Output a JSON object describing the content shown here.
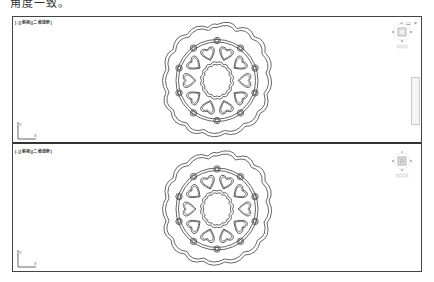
{
  "page": {
    "top_caption_cut": "角度一致。",
    "top_caption_cut_right": "一致一致"
  },
  "viewports": [
    {
      "id": "top",
      "label": "[-][俯视][二维线框]",
      "window_controls": "– ▭ ×",
      "viewcube": {
        "top": "北",
        "left": "西",
        "right": "东",
        "bottom": "南",
        "center": "上",
        "wcs_label": "WCS"
      },
      "ucs": {
        "x": "X",
        "y": "Y"
      },
      "has_navbar": true
    },
    {
      "id": "bottom",
      "label": "[-][俯视][二维线框]",
      "viewcube": {
        "top": "北",
        "left": "西",
        "right": "东",
        "bottom": "南",
        "center": "上",
        "wcs_label": "未命名"
      },
      "ucs": {
        "x": "X",
        "y": "Y"
      },
      "has_navbar": false
    }
  ],
  "drawing": {
    "object": "mandala-pattern",
    "outer_scallops": 12,
    "small_rings": 10,
    "hearts": 10,
    "inner_wavy_lobes": 12,
    "stroke_color": "#555555"
  }
}
